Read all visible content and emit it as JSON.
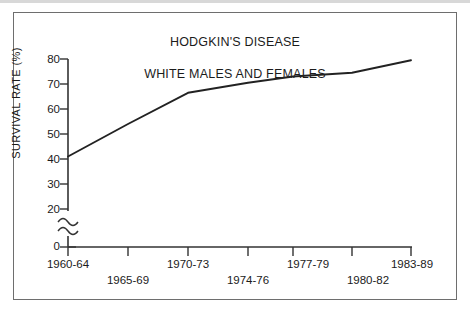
{
  "figure": {
    "title_line1": "HODGKIN'S DISEASE",
    "title_line2": "WHITE MALES AND FEMALES",
    "title": "HODGKIN'S DISEASE\nWHITE MALES AND FEMALES",
    "ylabel": "SURVIVAL RATE (%)",
    "line_color": "#222222",
    "axis_color": "#333333",
    "border_color": "#6e6e6e",
    "background": "#ffffff"
  },
  "chart_data": {
    "type": "line",
    "title": "HODGKIN'S DISEASE WHITE MALES AND FEMALES",
    "xlabel": "",
    "ylabel": "SURVIVAL RATE (%)",
    "categories": [
      "1960-64",
      "1965-69",
      "1970-73",
      "1974-76",
      "1977-79",
      "1980-82",
      "1983-89"
    ],
    "values": [
      41,
      54,
      66.5,
      70.5,
      73,
      74.5,
      79.5
    ],
    "series": [
      {
        "name": "White males and females",
        "values": [
          41,
          54,
          66.5,
          70.5,
          73,
          74.5,
          79.5
        ]
      }
    ],
    "ytick_labels": [
      "0",
      "20",
      "30",
      "40",
      "50",
      "60",
      "70",
      "80"
    ],
    "ytick_values": [
      0,
      20,
      30,
      40,
      50,
      60,
      70,
      80
    ],
    "ylim": [
      0,
      80
    ],
    "axis_break": true,
    "axis_break_between": [
      0,
      20
    ],
    "grid": false,
    "legend": false,
    "legend_position": "none"
  }
}
